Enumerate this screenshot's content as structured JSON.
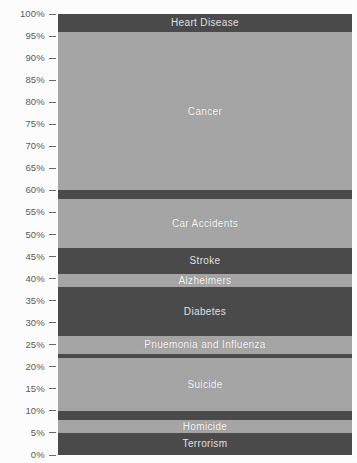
{
  "chart_title": "...causes of no-why death",
  "axis": {
    "y_label_suffix": "%",
    "ticks": [
      "100%",
      "95%",
      "90%",
      "85%",
      "80%",
      "75%",
      "70%",
      "65%",
      "60%",
      "55%",
      "50%",
      "45%",
      "40%",
      "35%",
      "30%",
      "25%",
      "20%",
      "15%",
      "10%",
      "5%",
      "0%"
    ]
  },
  "colors": {
    "dark_band": "#4a4a4a",
    "light_band": "#a6a6a6",
    "label_text": "#ffffff",
    "axis_text": "#5b5b5b",
    "background": "#ffffff"
  },
  "chart_data": {
    "type": "bar",
    "orientation": "stacked-vertical-single-bar",
    "title": "...causes of no-why death",
    "xlabel": "",
    "ylabel": "",
    "ylim": [
      0,
      100
    ],
    "grid": false,
    "legend": "none",
    "categories": [
      "Heart Disease",
      "Cancer",
      "Car Accidents",
      "Stroke",
      "Alzheimers",
      "Diabetes",
      "Pnuemonia and Influenza",
      "Suicide",
      "Homicide",
      "Terrorism"
    ],
    "values": [
      4,
      36,
      14,
      6,
      3,
      11,
      5,
      13,
      3,
      5
    ],
    "segments": [
      {
        "label": "Heart Disease",
        "top_pct": 100,
        "bottom_pct": 96,
        "value": 4,
        "shade": "dark"
      },
      {
        "label": "Cancer",
        "top_pct": 96,
        "bottom_pct": 60,
        "value": 36,
        "shade": "light"
      },
      {
        "label": "",
        "top_pct": 60,
        "bottom_pct": 58,
        "value": 2,
        "shade": "dark"
      },
      {
        "label": "Car Accidents",
        "top_pct": 58,
        "bottom_pct": 47,
        "value": 11,
        "shade": "light"
      },
      {
        "label": "Stroke",
        "top_pct": 47,
        "bottom_pct": 41,
        "value": 6,
        "shade": "dark"
      },
      {
        "label": "Alzheimers",
        "top_pct": 41,
        "bottom_pct": 38,
        "value": 3,
        "shade": "light"
      },
      {
        "label": "Diabetes",
        "top_pct": 38,
        "bottom_pct": 27,
        "value": 11,
        "shade": "dark"
      },
      {
        "label": "Pnuemonia and Influenza",
        "top_pct": 27,
        "bottom_pct": 23,
        "value": 4,
        "shade": "light"
      },
      {
        "label": "",
        "top_pct": 23,
        "bottom_pct": 22,
        "value": 1,
        "shade": "dark"
      },
      {
        "label": "Suicide",
        "top_pct": 22,
        "bottom_pct": 10,
        "value": 12,
        "shade": "light"
      },
      {
        "label": "",
        "top_pct": 10,
        "bottom_pct": 8,
        "value": 2,
        "shade": "dark"
      },
      {
        "label": "Homicide",
        "top_pct": 8,
        "bottom_pct": 5,
        "value": 3,
        "shade": "light"
      },
      {
        "label": "Terrorism",
        "top_pct": 5,
        "bottom_pct": 0,
        "value": 5,
        "shade": "dark"
      }
    ]
  }
}
